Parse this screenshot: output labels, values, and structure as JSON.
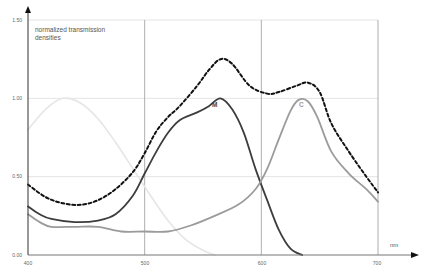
{
  "chart_data": {
    "type": "line",
    "title": "",
    "ylabel": "normalized transmission densities",
    "xlabel": "nm",
    "xlim": [
      400,
      700
    ],
    "ylim": [
      0,
      1.5
    ],
    "x_ticks": [
      "400",
      "500",
      "600",
      "700"
    ],
    "y_ticks": [
      "0.00",
      "0.50",
      "1.00",
      "1.50"
    ],
    "grid": true,
    "series": [
      {
        "name": "Y",
        "label_visible": false,
        "style": "solid-lightgray",
        "x": [
          400,
          415,
          430,
          445,
          460,
          475,
          490,
          505,
          520,
          535,
          550,
          560
        ],
        "values": [
          0.8,
          0.93,
          1.0,
          0.97,
          0.87,
          0.72,
          0.55,
          0.38,
          0.22,
          0.1,
          0.03,
          0.0
        ]
      },
      {
        "name": "M",
        "label_visible": true,
        "style": "solid-darkgray",
        "x": [
          400,
          410,
          420,
          440,
          460,
          475,
          490,
          500,
          510,
          520,
          530,
          545,
          555,
          565,
          575,
          585,
          595,
          605,
          615,
          625,
          635
        ],
        "values": [
          0.31,
          0.26,
          0.23,
          0.21,
          0.22,
          0.26,
          0.38,
          0.52,
          0.66,
          0.78,
          0.86,
          0.91,
          0.95,
          1.0,
          0.93,
          0.78,
          0.55,
          0.35,
          0.16,
          0.04,
          0.0
        ]
      },
      {
        "name": "C",
        "label_visible": true,
        "style": "solid-midgray",
        "x": [
          400,
          410,
          420,
          440,
          460,
          480,
          500,
          520,
          540,
          560,
          580,
          595,
          605,
          615,
          625,
          632,
          640,
          648,
          660,
          675,
          690,
          700
        ],
        "values": [
          0.26,
          0.21,
          0.18,
          0.18,
          0.18,
          0.15,
          0.15,
          0.15,
          0.19,
          0.25,
          0.32,
          0.42,
          0.55,
          0.74,
          0.92,
          0.99,
          0.98,
          0.88,
          0.66,
          0.52,
          0.42,
          0.34
        ]
      },
      {
        "name": "Sum (C+M+Y)",
        "label_visible": false,
        "style": "dashed-black",
        "x": [
          400,
          415,
          430,
          445,
          460,
          475,
          490,
          500,
          510,
          520,
          530,
          545,
          555,
          565,
          575,
          590,
          605,
          615,
          630,
          640,
          650,
          660,
          675,
          690,
          700
        ],
        "values": [
          0.45,
          0.37,
          0.33,
          0.32,
          0.35,
          0.42,
          0.53,
          0.65,
          0.79,
          0.88,
          0.95,
          1.08,
          1.18,
          1.25,
          1.22,
          1.08,
          1.03,
          1.04,
          1.08,
          1.1,
          1.04,
          0.84,
          0.66,
          0.5,
          0.4
        ]
      }
    ]
  },
  "axis": {
    "y_title_line1": "normalized transmission",
    "y_title_line2": "densities",
    "x_unit": "nm",
    "y_labels": [
      "0.00",
      "0.50",
      "1.00",
      "1.50"
    ],
    "x_labels": [
      "400",
      "500",
      "600",
      "700"
    ]
  },
  "labels": {
    "M": "M",
    "C": "C"
  }
}
